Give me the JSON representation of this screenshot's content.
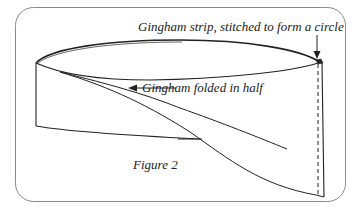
{
  "diagram": {
    "type": "sewing-illustration",
    "labels": {
      "strip": "Gingham strip, stitched to form a circle",
      "folded": "Gingham folded in half",
      "figure": "Figure 2"
    },
    "annotations": [
      {
        "text_key": "strip",
        "arrow_direction": "down",
        "points_to": "stitched seam at right edge"
      },
      {
        "text_key": "folded",
        "arrow_direction": "left",
        "points_to": "fold line of band"
      }
    ],
    "elements": [
      "rounded-frame",
      "top-ellipse-edge",
      "left-vertical-edge",
      "bottom-band-edge",
      "fold-diagonal-lines",
      "right-solid-edge",
      "right-dashed-seam"
    ],
    "colors": {
      "stroke": "#222222",
      "frame": "#8a8a8a",
      "background": "#ffffff"
    }
  }
}
